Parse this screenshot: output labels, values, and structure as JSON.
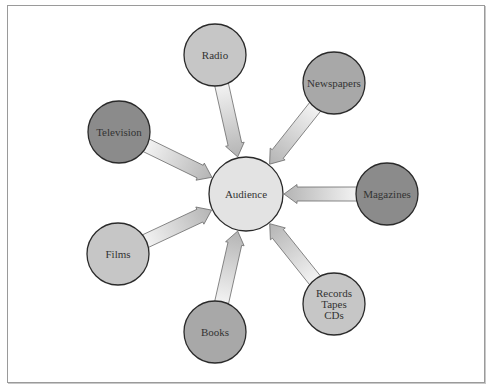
{
  "diagram": {
    "type": "hub-and-spoke",
    "center": {
      "id": "audience",
      "label": "Audience",
      "cx": 246,
      "cy": 194,
      "r": 37,
      "fill": "#e3e3e3"
    },
    "nodes": [
      {
        "id": "radio",
        "lines": [
          "Radio"
        ],
        "cx": 215,
        "cy": 55,
        "r": 31,
        "fill": "#c6c6c6"
      },
      {
        "id": "newspapers",
        "lines": [
          "Newspapers"
        ],
        "cx": 334,
        "cy": 83,
        "r": 31,
        "fill": "#a8a8a8"
      },
      {
        "id": "television",
        "lines": [
          "Television"
        ],
        "cx": 119,
        "cy": 132,
        "r": 31,
        "fill": "#8b8b8b"
      },
      {
        "id": "magazines",
        "lines": [
          "Magazines"
        ],
        "cx": 387,
        "cy": 194,
        "r": 31,
        "fill": "#8b8b8b"
      },
      {
        "id": "films",
        "lines": [
          "Films"
        ],
        "cx": 118,
        "cy": 254,
        "r": 31,
        "fill": "#c6c6c6"
      },
      {
        "id": "records",
        "lines": [
          "Records",
          "Tapes",
          "CDs"
        ],
        "cx": 334,
        "cy": 304,
        "r": 31,
        "fill": "#c6c6c6"
      },
      {
        "id": "books",
        "lines": [
          "Books"
        ],
        "cx": 215,
        "cy": 332,
        "r": 31,
        "fill": "#a8a8a8"
      }
    ],
    "edges_direction": "node-to-center",
    "arrow": {
      "shaft_width": 7,
      "head_width": 19,
      "head_length": 13,
      "gradient_tail": "#f4f4f4",
      "gradient_head": "#b4b4b4",
      "stroke": "#6a6a6a"
    },
    "stroke": "#2a2a2a"
  }
}
